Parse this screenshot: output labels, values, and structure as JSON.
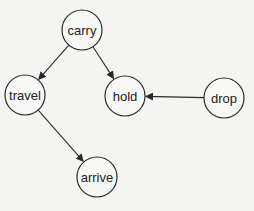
{
  "diagram": {
    "type": "directed-graph",
    "background": "#f4f4f2",
    "nodes": [
      {
        "id": "carry",
        "label": "carry",
        "x": 82,
        "y": 30,
        "r": 20
      },
      {
        "id": "travel",
        "label": "travel",
        "x": 25,
        "y": 95,
        "r": 20
      },
      {
        "id": "hold",
        "label": "hold",
        "x": 125,
        "y": 96,
        "r": 20
      },
      {
        "id": "drop",
        "label": "drop",
        "x": 224,
        "y": 98,
        "r": 20
      },
      {
        "id": "arrive",
        "label": "arrive",
        "x": 97,
        "y": 177,
        "r": 20
      }
    ],
    "edges": [
      {
        "from": "carry",
        "to": "travel"
      },
      {
        "from": "carry",
        "to": "hold"
      },
      {
        "from": "drop",
        "to": "hold"
      },
      {
        "from": "travel",
        "to": "arrive"
      }
    ]
  }
}
